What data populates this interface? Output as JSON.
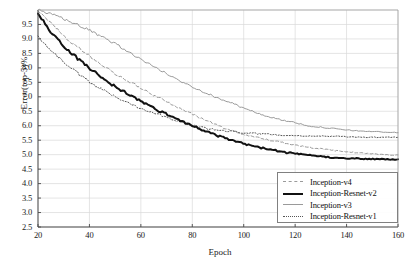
{
  "chart_data": {
    "type": "line",
    "title": "",
    "xlabel": "Epoch",
    "ylabel": "Error(top-5)%",
    "xlim": [
      20,
      160
    ],
    "ylim": [
      2.5,
      10.0
    ],
    "grid": true,
    "legend_position": "bottom-right",
    "xticks": [
      "20",
      "40",
      "60",
      "80",
      "100",
      "120",
      "140",
      "160"
    ],
    "xtick_values": [
      20,
      40,
      60,
      80,
      100,
      120,
      140,
      160
    ],
    "yticks": [
      "9.5",
      "9.0",
      "8.5",
      "8.0",
      "7.5",
      "7.0",
      "6.5",
      "6.0",
      "5.5",
      "5.0",
      "4.5",
      "4.0",
      "3.5",
      "3.0",
      "2.5"
    ],
    "ytick_values": [
      9.5,
      9.0,
      8.5,
      8.0,
      7.5,
      7.0,
      6.5,
      6.0,
      5.5,
      5.0,
      4.5,
      4.0,
      3.5,
      3.0,
      2.5
    ],
    "x": [
      20,
      25,
      30,
      35,
      40,
      45,
      50,
      55,
      60,
      65,
      70,
      75,
      80,
      85,
      90,
      95,
      100,
      105,
      110,
      115,
      120,
      125,
      130,
      135,
      140,
      145,
      150,
      155,
      160
    ],
    "series": [
      {
        "name": "Inception-v4",
        "style": "dashed",
        "color": "#9a9a9a",
        "width": 1,
        "values": [
          10.0,
          9.55,
          9.1,
          8.75,
          8.4,
          8.1,
          7.8,
          7.55,
          7.3,
          7.05,
          6.85,
          6.6,
          6.4,
          6.2,
          6.0,
          5.85,
          5.7,
          5.6,
          5.5,
          5.42,
          5.34,
          5.26,
          5.2,
          5.14,
          5.1,
          5.06,
          5.03,
          5.0,
          4.98
        ]
      },
      {
        "name": "Inception-Resnet-v2",
        "style": "solid",
        "color": "#111111",
        "width": 2,
        "values": [
          9.9,
          9.25,
          8.75,
          8.35,
          8.0,
          7.65,
          7.35,
          7.1,
          6.85,
          6.6,
          6.4,
          6.2,
          6.0,
          5.82,
          5.65,
          5.5,
          5.38,
          5.27,
          5.18,
          5.1,
          5.03,
          4.98,
          4.94,
          4.9,
          4.88,
          4.86,
          4.85,
          4.84,
          4.83
        ]
      },
      {
        "name": "Inception-v3",
        "style": "solid",
        "color": "#9a9a9a",
        "width": 1,
        "values": [
          10.0,
          9.85,
          9.7,
          9.5,
          9.3,
          9.05,
          8.85,
          8.55,
          8.3,
          8.05,
          7.8,
          7.55,
          7.35,
          7.15,
          6.95,
          6.8,
          6.6,
          6.45,
          6.3,
          6.2,
          6.1,
          6.0,
          5.95,
          5.9,
          5.85,
          5.82,
          5.8,
          5.78,
          5.76
        ]
      },
      {
        "name": "Inception-Resnet-v1",
        "style": "dotted",
        "color": "#555555",
        "width": 1,
        "values": [
          9.1,
          8.6,
          8.2,
          7.85,
          7.5,
          7.25,
          7.0,
          6.8,
          6.6,
          6.45,
          6.3,
          6.15,
          6.0,
          5.92,
          5.85,
          5.8,
          5.76,
          5.73,
          5.7,
          5.68,
          5.66,
          5.65,
          5.64,
          5.63,
          5.62,
          5.61,
          5.6,
          5.6,
          5.6
        ]
      }
    ]
  },
  "legend": {
    "items": [
      {
        "label": "Inception-v4"
      },
      {
        "label": "Inception-Resnet-v2"
      },
      {
        "label": "Inception-v3"
      },
      {
        "label": "Inception-Resnet-v1"
      }
    ]
  }
}
